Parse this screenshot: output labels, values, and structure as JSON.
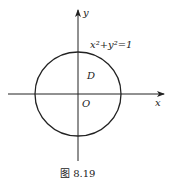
{
  "figure": {
    "caption": "图 8.19",
    "equation": "x²+y²=1",
    "region_label": "D",
    "origin_label": "O",
    "x_axis_label": "x",
    "y_axis_label": "y",
    "colors": {
      "stroke": "#222222",
      "background": "#ffffff"
    }
  }
}
